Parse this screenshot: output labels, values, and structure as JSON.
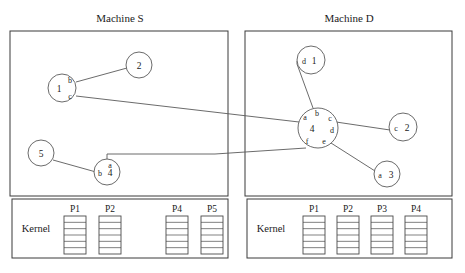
{
  "figure": {
    "type": "network-diagram",
    "background_color": "#ffffff",
    "line_color": "#5a5a5a",
    "text_color": "#1b1b1b"
  },
  "machines": [
    {
      "id": "machine-s",
      "title": "Machine S",
      "title_x": 120,
      "title_y": 22,
      "box": {
        "x": 10,
        "y": 31,
        "w": 218,
        "h": 165
      },
      "kernel": {
        "label": "Kernel",
        "label_x": 36,
        "label_y": 232,
        "box": {
          "x": 12,
          "y": 199,
          "w": 216,
          "h": 59
        },
        "processes": [
          {
            "label": "P1",
            "x": 64,
            "y": 212,
            "box_x": 64,
            "box_y": 216,
            "box_w": 22,
            "box_h": 38,
            "slots": 6
          },
          {
            "label": "P2",
            "x": 99,
            "y": 212,
            "box_x": 99,
            "box_y": 216,
            "box_w": 22,
            "box_h": 38,
            "slots": 6
          },
          {
            "label": "P4",
            "x": 166,
            "y": 212,
            "box_x": 166,
            "box_y": 216,
            "box_w": 22,
            "box_h": 38,
            "slots": 6
          },
          {
            "label": "P5",
            "x": 201,
            "y": 212,
            "box_x": 201,
            "box_y": 216,
            "box_w": 22,
            "box_h": 38,
            "slots": 6
          }
        ]
      }
    },
    {
      "id": "machine-d",
      "title": "Machine D",
      "title_x": 349,
      "title_y": 22,
      "box": {
        "x": 245,
        "y": 31,
        "w": 207,
        "h": 165
      },
      "kernel": {
        "label": "Kernel",
        "label_x": 271,
        "label_y": 232,
        "box": {
          "x": 247,
          "y": 199,
          "w": 205,
          "h": 59
        },
        "processes": [
          {
            "label": "P1",
            "x": 303,
            "y": 212,
            "box_x": 303,
            "box_y": 216,
            "box_w": 22,
            "box_h": 38,
            "slots": 6
          },
          {
            "label": "P2",
            "x": 337,
            "y": 212,
            "box_x": 337,
            "box_y": 216,
            "box_w": 22,
            "box_h": 38,
            "slots": 6
          },
          {
            "label": "P3",
            "x": 371,
            "y": 212,
            "box_x": 371,
            "box_y": 216,
            "box_w": 22,
            "box_h": 38,
            "slots": 6
          },
          {
            "label": "P4",
            "x": 405,
            "y": 212,
            "box_x": 405,
            "box_y": 216,
            "box_w": 22,
            "box_h": 38,
            "slots": 6
          }
        ]
      }
    }
  ],
  "nodes": [
    {
      "id": "node-1",
      "label": "1",
      "cx": 62,
      "cy": 88,
      "r": 14,
      "label_x": 59,
      "label_y": 92,
      "ports": [
        {
          "name": "b",
          "x": 70,
          "y": 83
        },
        {
          "name": "c",
          "x": 70,
          "y": 99
        }
      ]
    },
    {
      "id": "node-2",
      "label": "2",
      "cx": 139,
      "cy": 65,
      "r": 13,
      "label_x": 139,
      "label_y": 69,
      "ports": []
    },
    {
      "id": "node-5",
      "label": "5",
      "cx": 41,
      "cy": 153,
      "r": 13,
      "label_x": 41,
      "label_y": 157,
      "ports": []
    },
    {
      "id": "node-4-s",
      "label": "4",
      "cx": 107,
      "cy": 172,
      "r": 13,
      "label_x": 110,
      "label_y": 176,
      "ports": [
        {
          "name": "a",
          "x": 110,
          "y": 168
        },
        {
          "name": "b",
          "x": 100,
          "y": 176
        }
      ]
    },
    {
      "id": "node-d1",
      "label": "1",
      "cx": 311,
      "cy": 60,
      "r": 14,
      "label_x": 314,
      "label_y": 64,
      "ports": [
        {
          "name": "d",
          "x": 304,
          "y": 64
        }
      ]
    },
    {
      "id": "node-4-d",
      "label": "4",
      "cx": 318,
      "cy": 128,
      "r": 20,
      "label_x": 312,
      "label_y": 132,
      "ports": [
        {
          "name": "a",
          "x": 305,
          "y": 120
        },
        {
          "name": "b",
          "x": 317,
          "y": 116
        },
        {
          "name": "c",
          "x": 330,
          "y": 121
        },
        {
          "name": "d",
          "x": 332,
          "y": 133
        },
        {
          "name": "e",
          "x": 324,
          "y": 144
        },
        {
          "name": "f",
          "x": 307,
          "y": 144
        }
      ]
    },
    {
      "id": "node-c2",
      "label": "2",
      "cx": 403,
      "cy": 127,
      "r": 14,
      "label_x": 407,
      "label_y": 131,
      "ports": [
        {
          "name": "c",
          "x": 396,
          "y": 131
        }
      ]
    },
    {
      "id": "node-a3",
      "label": "3",
      "cx": 387,
      "cy": 174,
      "r": 13,
      "label_x": 391,
      "label_y": 178,
      "ports": [
        {
          "name": "a",
          "x": 380,
          "y": 178
        }
      ]
    }
  ],
  "links": [
    {
      "id": "link-1b-to-2",
      "from": "node-1.b",
      "to": "node-2",
      "points": "76,82 127,68"
    },
    {
      "id": "link-1c-to-4d-a",
      "from": "node-1.c",
      "to": "node-4-d.a",
      "points": "76,96 299,122"
    },
    {
      "id": "link-5-to-4s",
      "from": "node-5",
      "to": "node-4-s",
      "points": "53,160 96,172"
    },
    {
      "id": "link-4s-a-to-4d-f",
      "from": "node-4-s.a",
      "to": "node-4-d.f",
      "points": "107,159 107,154 215,154 306,148"
    },
    {
      "id": "link-d1-to-4d-b",
      "from": "node-d1.d",
      "to": "node-4-d.b",
      "points": "297,61 297,64 313,108"
    },
    {
      "id": "link-4d-c-to-c2",
      "from": "node-4-d.c",
      "to": "node-c2.c",
      "points": "336,122 390,130"
    },
    {
      "id": "link-4d-e-to-a3",
      "from": "node-4-d.e",
      "to": "node-a3.a",
      "points": "331,143 375,171"
    }
  ]
}
